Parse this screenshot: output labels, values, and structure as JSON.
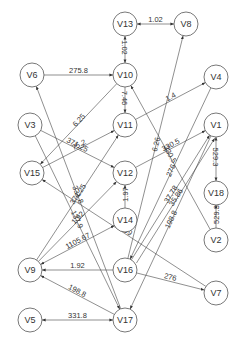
{
  "diagram": {
    "type": "directed-weighted-graph",
    "node_radius": 12,
    "nodes": [
      {
        "id": "V13",
        "x": 125,
        "y": 24
      },
      {
        "id": "V8",
        "x": 186,
        "y": 24
      },
      {
        "id": "V6",
        "x": 32,
        "y": 75
      },
      {
        "id": "V10",
        "x": 125,
        "y": 75
      },
      {
        "id": "V4",
        "x": 216,
        "y": 77
      },
      {
        "id": "V3",
        "x": 30,
        "y": 125
      },
      {
        "id": "V11",
        "x": 125,
        "y": 125
      },
      {
        "id": "V1",
        "x": 216,
        "y": 125
      },
      {
        "id": "V12",
        "x": 125,
        "y": 173
      },
      {
        "id": "V15",
        "x": 32,
        "y": 173
      },
      {
        "id": "V18",
        "x": 216,
        "y": 193
      },
      {
        "id": "V14",
        "x": 125,
        "y": 220
      },
      {
        "id": "V2",
        "x": 216,
        "y": 240
      },
      {
        "id": "V9",
        "x": 30,
        "y": 270
      },
      {
        "id": "V16",
        "x": 125,
        "y": 270
      },
      {
        "id": "V7",
        "x": 216,
        "y": 293
      },
      {
        "id": "V5",
        "x": 30,
        "y": 320
      },
      {
        "id": "V17",
        "x": 125,
        "y": 320
      }
    ],
    "edges": [
      {
        "from": "V13",
        "to": "V8",
        "label": "1.02",
        "bidirectional": true
      },
      {
        "from": "V13",
        "to": "V10",
        "label": "1.02",
        "bidirectional": true
      },
      {
        "from": "V6",
        "to": "V10",
        "label": "275.8",
        "bidirectional": false
      },
      {
        "from": "V17",
        "to": "V6",
        "label": "331.8",
        "bidirectional": false
      },
      {
        "from": "V10",
        "to": "V11",
        "label": "7.46",
        "bidirectional": false
      },
      {
        "from": "V10",
        "to": "V15",
        "label": "6.25",
        "bidirectional": false
      },
      {
        "from": "V16",
        "to": "V8",
        "label": "6.26",
        "bidirectional": false
      },
      {
        "from": "V11",
        "to": "V4",
        "label": "1.4",
        "bidirectional": false
      },
      {
        "from": "V2",
        "to": "V10",
        "label": "330.5",
        "bidirectional": false
      },
      {
        "from": "V3",
        "to": "V12",
        "label": "371.25",
        "bidirectional": false
      },
      {
        "from": "V3",
        "to": "V17",
        "label": "137.9",
        "bidirectional": false
      },
      {
        "from": "V15",
        "to": "V11",
        "label": "75.2",
        "bidirectional": false
      },
      {
        "from": "V9",
        "to": "V11",
        "label": "371.25",
        "bidirectional": false
      },
      {
        "from": "V12",
        "to": "V1",
        "label": "330.5",
        "bidirectional": false
      },
      {
        "from": "V9",
        "to": "V12",
        "label": "1.92",
        "bidirectional": false
      },
      {
        "from": "V14",
        "to": "V12",
        "label": "1.97",
        "bidirectional": false
      },
      {
        "from": "V1",
        "to": "V18",
        "label": "529.3",
        "bidirectional": true
      },
      {
        "from": "V2",
        "to": "V18",
        "label": "529.3",
        "bidirectional": false
      },
      {
        "from": "V4",
        "to": "V16",
        "label": "276",
        "bidirectional": false
      },
      {
        "from": "V16",
        "to": "V1",
        "label": "37.78",
        "bidirectional": false
      },
      {
        "from": "V16",
        "to": "V1",
        "label": "35.86",
        "bidirectional": false,
        "offset": 6
      },
      {
        "from": "V7",
        "to": "V15",
        "label": "68.99",
        "bidirectional": false
      },
      {
        "from": "V9",
        "to": "V14",
        "label": "1105.67",
        "bidirectional": true
      },
      {
        "from": "V16",
        "to": "V9",
        "label": "1.92",
        "bidirectional": false
      },
      {
        "from": "V16",
        "to": "V7",
        "label": "276",
        "bidirectional": false
      },
      {
        "from": "V1",
        "to": "V17",
        "label": "198.8",
        "bidirectional": false
      },
      {
        "from": "V17",
        "to": "V9",
        "label": "198.8",
        "bidirectional": false
      },
      {
        "from": "V5",
        "to": "V17",
        "label": "331.8",
        "bidirectional": true
      }
    ]
  },
  "colors": {
    "background": "#ffffff",
    "stroke": "#444444",
    "text": "#333333"
  }
}
